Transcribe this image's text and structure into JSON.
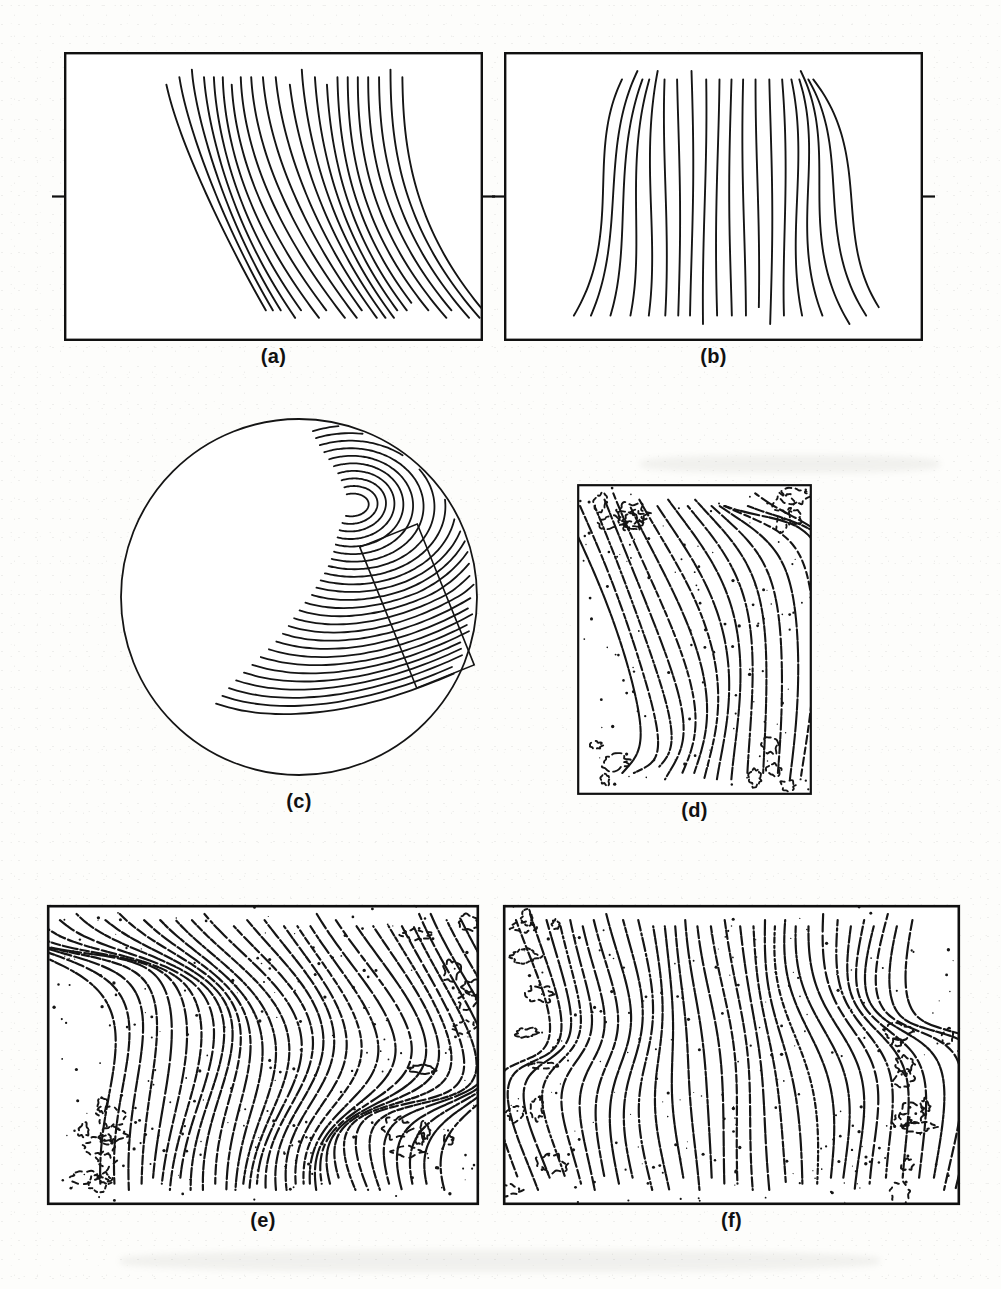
{
  "figure": {
    "kind": "fingerprint-ridge-flow-figure",
    "background_color": "#fdfdfb",
    "ink_color": "#151515",
    "panel_count": 6
  },
  "panels": [
    {
      "id": "a",
      "caption": "(a)",
      "shape": "rectangle",
      "style": "smooth-traced",
      "x": 64,
      "y": 52,
      "w": 419,
      "h": 289,
      "caption_y": 345,
      "border_width": 2.4,
      "ridge_width": 1.9,
      "side_ticks": true,
      "content_inset": {
        "left": 60,
        "right": 52,
        "top": 8,
        "bottom": 6
      },
      "description": "Smooth traced ridge flow, curved fan from upper-left with a delta at lower-left"
    },
    {
      "id": "b",
      "caption": "(b)",
      "shape": "rectangle",
      "style": "smooth-traced",
      "x": 504,
      "y": 52,
      "w": 419,
      "h": 289,
      "caption_y": 345,
      "border_width": 2.4,
      "ridge_width": 1.9,
      "side_ticks": true,
      "content_inset": {
        "left": 72,
        "right": 56,
        "top": 8,
        "bottom": 6
      },
      "description": "Smooth traced near-vertical ridge flow with loop feature on the right"
    },
    {
      "id": "c",
      "caption": "(c)",
      "shape": "circle",
      "style": "smooth-traced",
      "x": 120,
      "y": 418,
      "w": 358,
      "h": 358,
      "caption_y": 790,
      "border_width": 1.8,
      "ridge_width": 1.8,
      "side_ticks": false,
      "roi_box": {
        "cx": 297,
        "cy": 188,
        "w": 62,
        "h": 152,
        "rotation": -22
      },
      "description": "Circular fingerprint model with whorl core top-right, loop core left, delta junction and tilted region-of-interest box"
    },
    {
      "id": "d",
      "caption": "(d)",
      "shape": "rectangle",
      "style": "thinned-noisy",
      "x": 577,
      "y": 484,
      "w": 235,
      "h": 311,
      "caption_y": 799,
      "border_width": 2.2,
      "ridge_width": 2.1,
      "side_ticks": false,
      "dash": "9 3 4 3 2 4",
      "description": "Thinned skeleton of the boxed region, broken ridges with spur noise in corners"
    },
    {
      "id": "e",
      "caption": "(e)",
      "shape": "rectangle",
      "style": "thinned-noisy",
      "x": 47,
      "y": 905,
      "w": 432,
      "h": 300,
      "caption_y": 1209,
      "border_width": 2.6,
      "ridge_width": 2.2,
      "side_ticks": false,
      "dash": "11 3 5 3 3 4",
      "description": "Dense thinned fingerprint skeleton, core loop upper-left and recurving ridges at right"
    },
    {
      "id": "f",
      "caption": "(f)",
      "shape": "rectangle",
      "style": "thinned-noisy",
      "x": 503,
      "y": 905,
      "w": 457,
      "h": 300,
      "caption_y": 1209,
      "border_width": 2.6,
      "ridge_width": 2.2,
      "side_ticks": false,
      "dash": "11 3 5 3 3 4",
      "description": "Dense thinned fingerprint skeleton with near-vertical ridges and noisy recurves at both edges"
    }
  ],
  "chart_data": {
    "type": "line",
    "xlabel": "",
    "ylabel": "",
    "panel_labels": [
      "(a)",
      "(b)",
      "(c)",
      "(d)",
      "(e)",
      "(f)"
    ],
    "series": [
      {
        "name": "(a) traced ridges",
        "values": [
          22
        ],
        "note": "22 curved ridge strands, fan curvature, delta near lower-left"
      },
      {
        "name": "(b) traced ridges",
        "values": [
          20
        ],
        "note": "20 near-vertical ridge strands, loop/island feature right of centre"
      },
      {
        "name": "(c) circular model ridges",
        "values": [
          26
        ],
        "note": "26 concentric/arched ridges, whorl core, loop core, one delta junction"
      },
      {
        "name": "(d) thinned ridges",
        "values": [
          17
        ],
        "note": "17 broken skeleton ridges inside square window"
      },
      {
        "name": "(e) thinned ridges",
        "values": [
          34
        ],
        "note": "34 dense skeleton ridges with core at upper-left"
      },
      {
        "name": "(f) thinned ridges",
        "values": [
          32
        ],
        "note": "32 dense skeleton ridges, noise bands on both sides"
      }
    ],
    "grid": false,
    "legend": "none"
  }
}
